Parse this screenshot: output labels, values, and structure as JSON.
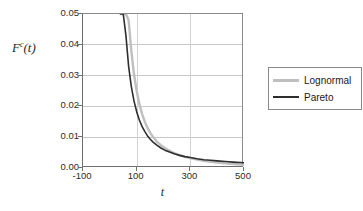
{
  "chart_data": {
    "type": "line",
    "title": "",
    "xlabel": "t",
    "ylabel": "Fᶜ(t)",
    "ylabel_base": "F",
    "ylabel_sup": "c",
    "ylabel_arg": "(t)",
    "xlim": [
      -100,
      500
    ],
    "ylim": [
      0.0,
      0.05
    ],
    "grid": true,
    "grid_axis": "y",
    "legend_position": "right",
    "xticks": [
      -100,
      100,
      300,
      500
    ],
    "xticklabels": [
      "-100",
      "100",
      "300",
      "500"
    ],
    "yticks": [
      0.0,
      0.01,
      0.02,
      0.03,
      0.04,
      0.05
    ],
    "yticklabels": [
      "0.00",
      "0.01",
      "0.02",
      "0.03",
      "0.04",
      "0.05"
    ],
    "series": [
      {
        "name": "Lognormal",
        "color": "#bfbfbf",
        "width": 2.4,
        "x": [
          40,
          50,
          60,
          70,
          80,
          90,
          100,
          110,
          120,
          130,
          140,
          150,
          160,
          175,
          190,
          205,
          220,
          240,
          260,
          280,
          300,
          325,
          350,
          375,
          400,
          430,
          460,
          500
        ],
        "y": [
          0.05,
          0.05,
          0.05,
          0.048,
          0.038,
          0.0305,
          0.025,
          0.0208,
          0.0176,
          0.0151,
          0.0131,
          0.0115,
          0.0102,
          0.0086,
          0.0074,
          0.0065,
          0.0057,
          0.0048,
          0.0042,
          0.0036,
          0.0032,
          0.0027,
          0.0023,
          0.002,
          0.0018,
          0.0015,
          0.0013,
          0.001
        ]
      },
      {
        "name": "Pareto",
        "color": "#2e2e2e",
        "width": 1.6,
        "x": [
          40,
          50,
          60,
          70,
          80,
          90,
          100,
          110,
          120,
          130,
          140,
          150,
          160,
          175,
          190,
          205,
          220,
          240,
          260,
          280,
          300,
          325,
          350,
          375,
          400,
          430,
          460,
          500
        ],
        "y": [
          0.05,
          0.05,
          0.043,
          0.033,
          0.0265,
          0.0218,
          0.0183,
          0.0156,
          0.0135,
          0.0119,
          0.0105,
          0.0094,
          0.0085,
          0.0074,
          0.0065,
          0.0058,
          0.0053,
          0.0046,
          0.0041,
          0.0037,
          0.0034,
          0.003,
          0.0027,
          0.0025,
          0.0023,
          0.0021,
          0.0019,
          0.0017
        ]
      }
    ]
  },
  "legend": {
    "items": [
      {
        "label": "Lognormal",
        "color": "#bfbfbf"
      },
      {
        "label": "Pareto",
        "color": "#2e2e2e"
      }
    ]
  }
}
